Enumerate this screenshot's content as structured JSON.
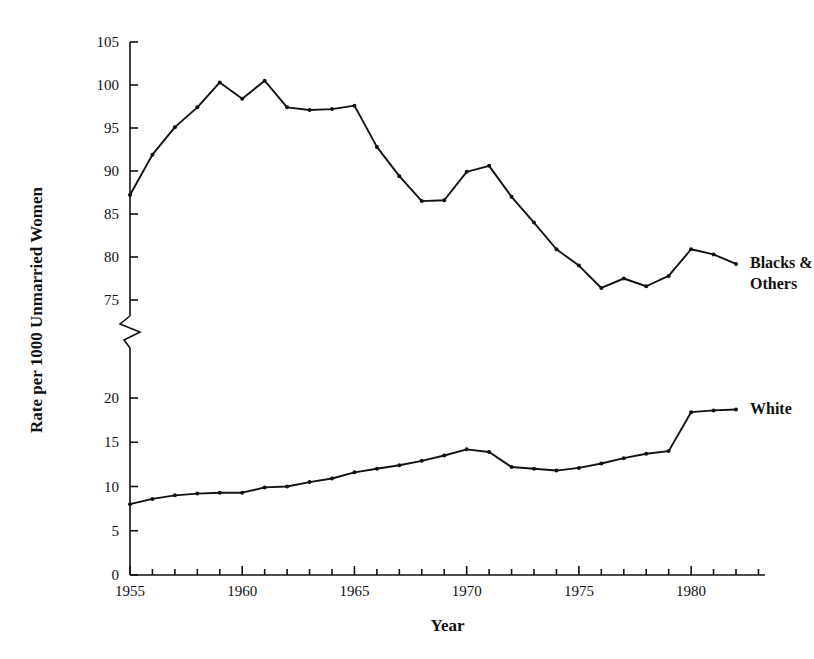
{
  "chart_data": {
    "type": "line",
    "title": "",
    "xlabel": "Year",
    "ylabel": "Rate per 1000 Unmarried Women",
    "xlim": [
      1954.5,
      1983.5
    ],
    "grid": false,
    "legend_position": "inline-right-of-series",
    "axis_break": {
      "present": true,
      "lower_top": 22,
      "upper_bottom": 73
    },
    "y_axis_upper": {
      "ticks": [
        75,
        80,
        85,
        90,
        95,
        100,
        105
      ],
      "range": [
        75,
        105
      ]
    },
    "y_axis_lower": {
      "ticks": [
        0,
        5,
        10,
        15,
        20
      ],
      "range": [
        0,
        20
      ]
    },
    "x_ticks_major": [
      1955,
      1960,
      1965,
      1970,
      1975,
      1980
    ],
    "x_tick_labels": [
      "1955",
      "1960",
      "1965",
      "1970",
      "1975",
      "1980"
    ],
    "x_minor_every": 1,
    "x": [
      1955,
      1956,
      1957,
      1958,
      1959,
      1960,
      1961,
      1962,
      1963,
      1964,
      1965,
      1966,
      1967,
      1968,
      1969,
      1970,
      1971,
      1972,
      1973,
      1974,
      1975,
      1976,
      1977,
      1978,
      1979,
      1980,
      1981,
      1982
    ],
    "series": [
      {
        "name": "Blacks & Others",
        "label_lines": [
          "Blacks &",
          "Others"
        ],
        "color": "#111111",
        "marker": "dot",
        "values": [
          87.2,
          91.9,
          95.1,
          97.4,
          100.3,
          98.4,
          100.5,
          97.4,
          97.1,
          97.2,
          97.6,
          92.8,
          89.4,
          86.5,
          86.6,
          89.9,
          90.6,
          87.0,
          84.0,
          80.9,
          79.0,
          76.4,
          77.5,
          76.6,
          77.8,
          80.9,
          80.3,
          79.2
        ]
      },
      {
        "name": "White",
        "label_lines": [
          "White"
        ],
        "color": "#111111",
        "marker": "dot",
        "values": [
          8.0,
          8.6,
          9.0,
          9.2,
          9.3,
          9.3,
          9.9,
          10.0,
          10.5,
          10.9,
          11.6,
          12.0,
          12.4,
          12.9,
          13.5,
          14.2,
          13.9,
          12.2,
          12.0,
          11.8,
          12.1,
          12.6,
          13.2,
          13.7,
          14.0,
          18.4,
          18.6,
          18.7
        ]
      }
    ]
  },
  "figure": {
    "background_color": "#ffffff",
    "ink_color": "#111111"
  }
}
